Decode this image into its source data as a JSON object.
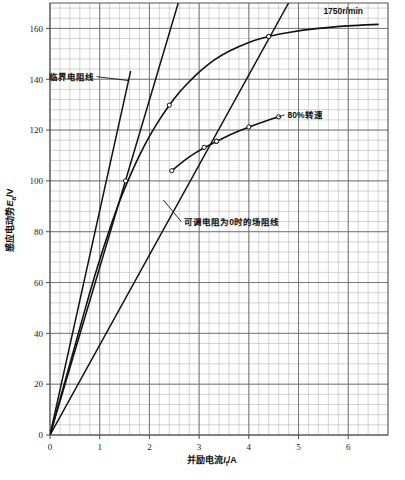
{
  "chart_data": {
    "type": "line",
    "title": "",
    "xlabel": "并励电流I_f/A",
    "ylabel": "感应电动势E_a/V",
    "xlim": [
      0,
      6.8
    ],
    "ylim": [
      0,
      170
    ],
    "xticks": [
      "0",
      "1",
      "2",
      "3",
      "4",
      "5",
      "6"
    ],
    "xtick_values": [
      0,
      1,
      2,
      3,
      4,
      5,
      6
    ],
    "yticks": [
      "0",
      "20",
      "40",
      "60",
      "80",
      "100",
      "120",
      "140",
      "160"
    ],
    "ytick_values": [
      0,
      20,
      40,
      60,
      80,
      100,
      120,
      140,
      160
    ],
    "grid": true,
    "minor_grid": true,
    "legend": "none",
    "series": [
      {
        "name": "1750r/min",
        "kind": "magnetization-curve",
        "label": "1750r/min",
        "points": [
          [
            0.0,
            0.0
          ],
          [
            0.2,
            14.0
          ],
          [
            0.4,
            28.0
          ],
          [
            0.6,
            42.0
          ],
          [
            0.8,
            56.0
          ],
          [
            1.0,
            69.0
          ],
          [
            1.2,
            81.0
          ],
          [
            1.4,
            92.0
          ],
          [
            1.6,
            101.5
          ],
          [
            1.8,
            110.0
          ],
          [
            2.0,
            117.5
          ],
          [
            2.2,
            124.0
          ],
          [
            2.4,
            129.8
          ],
          [
            2.6,
            134.8
          ],
          [
            2.8,
            139.0
          ],
          [
            3.0,
            142.8
          ],
          [
            3.3,
            147.5
          ],
          [
            3.6,
            151.0
          ],
          [
            4.0,
            154.5
          ],
          [
            4.4,
            156.8
          ],
          [
            4.8,
            158.4
          ],
          [
            5.4,
            160.0
          ],
          [
            6.0,
            161.0
          ],
          [
            6.6,
            161.6
          ]
        ],
        "markers": [
          [
            2.4,
            129.8
          ],
          [
            4.4,
            156.8
          ]
        ]
      },
      {
        "name": "80%转速",
        "kind": "magnetization-curve-partial",
        "label": "80%转速",
        "points": [
          [
            2.45,
            104.0
          ],
          [
            2.7,
            108.0
          ],
          [
            2.95,
            111.3
          ],
          [
            3.2,
            114.0
          ],
          [
            3.5,
            117.0
          ],
          [
            3.8,
            119.6
          ],
          [
            4.1,
            121.9
          ],
          [
            4.4,
            124.0
          ],
          [
            4.6,
            125.2
          ]
        ],
        "markers": [
          [
            2.45,
            104.0
          ],
          [
            3.1,
            113.2
          ],
          [
            3.35,
            115.6
          ],
          [
            4.0,
            121.2
          ],
          [
            4.6,
            125.2
          ]
        ]
      },
      {
        "name": "临界电阻线",
        "kind": "straight-line",
        "label": "临界电阻线",
        "points": [
          [
            0.0,
            0.0
          ],
          [
            1.62,
            143.0
          ]
        ],
        "slope_ohm": 88.3
      },
      {
        "name": "场阻线-中",
        "kind": "straight-line",
        "label": "",
        "points": [
          [
            0.0,
            0.0
          ],
          [
            2.58,
            170.0
          ]
        ],
        "slope_ohm": 65.9,
        "markers": [
          [
            1.52,
            100.0
          ]
        ]
      },
      {
        "name": "可调电阻为0时的场阻线",
        "kind": "straight-line",
        "label": "可调电阻为0时的场阻线",
        "points": [
          [
            0.0,
            0.0
          ],
          [
            4.8,
            170.0
          ]
        ],
        "slope_ohm": 35.4,
        "markers": [
          [
            3.35,
            115.6
          ],
          [
            4.4,
            156.8
          ]
        ]
      }
    ],
    "annotations": [
      {
        "name": "critical-resistance-label",
        "text": "临界电阻线",
        "text_xy": [
          0.88,
          141.0
        ],
        "leader_to": [
          1.57,
          139.5
        ]
      },
      {
        "name": "eighty-percent-speed-label",
        "text": "80%转速",
        "text_xy": [
          4.78,
          126.0
        ],
        "leader_to": [
          4.6,
          125.2
        ]
      },
      {
        "name": "zero-rheostat-field-line-label",
        "text": "可调电阻为0时的场阻线",
        "text_xy": [
          2.7,
          84.0
        ],
        "leader_to": [
          2.28,
          92.5
        ]
      },
      {
        "name": "rated-speed-label",
        "text": "1750r/min",
        "text_xy": [
          5.5,
          167.0
        ],
        "leader_to": null
      }
    ]
  },
  "axis": {
    "ylabel_parts": {
      "main": "感应电动势",
      "sym": "E",
      "sub": "a",
      "unit": "/V"
    },
    "xlabel_parts": {
      "main": "并励电流",
      "sym": "I",
      "sub": "f",
      "unit": "/A"
    }
  },
  "colors": {
    "background": "#ffffff",
    "plot_background": "#ffffff",
    "grid_minor": "#a8a8a8",
    "grid_major": "#6e6e6e",
    "axis": "#4a4a4a",
    "curve": "#121212",
    "text": "#121212"
  }
}
